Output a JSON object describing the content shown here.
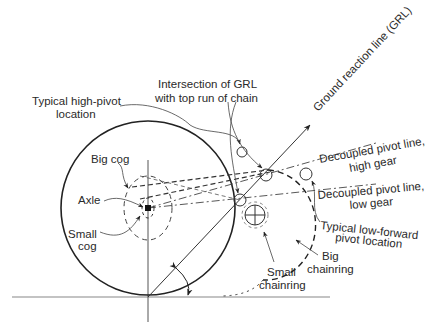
{
  "diagram": {
    "labels": {
      "grl": "Ground reaction line (GRL)",
      "intersection_line1": "Intersection of GRL",
      "intersection_line2": "with top run of chain",
      "high_pivot_line1": "Typical high-pivot",
      "high_pivot_line2": "location",
      "big_cog": "Big cog",
      "axle": "Axle",
      "small_cog_line1": "Small",
      "small_cog_line2": "cog",
      "decoupled_high_line1": "Decoupled pivot line,",
      "decoupled_high_line2": "high gear",
      "decoupled_low_line1": "Decoupled pivot line,",
      "decoupled_low_line2": "low gear",
      "low_forward_line1": "Typical low-forward",
      "low_forward_line2": "pivot location",
      "big_chainring_line1": "Big",
      "big_chainring_line2": "chainring",
      "small_chainring_line1": "Small",
      "small_chainring_line2": "chainring"
    },
    "colors": {
      "stroke": "#222222",
      "text": "#2a2a2a",
      "ground": "#888888"
    }
  }
}
